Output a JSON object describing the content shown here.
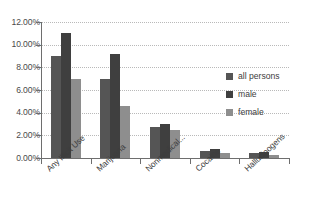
{
  "chart_data": {
    "type": "bar",
    "title": "",
    "xlabel": "",
    "ylabel": "",
    "grid": true,
    "legend_position": "right",
    "ylim": [
      0,
      12
    ],
    "ytick_labels": [
      "12.00%",
      "10.00%",
      "8.00%",
      "6.00%",
      "4.00%",
      "2.00%",
      "0.00%"
    ],
    "ytick_values": [
      12,
      10,
      8,
      6,
      4,
      2,
      0
    ],
    "categories": [
      "Any Illicit Use",
      "Marijuana",
      "Nonmedical...",
      "Cocaine",
      "Hallucinogens"
    ],
    "series": [
      {
        "name": "all persons",
        "color": "#555555",
        "values": [
          9.0,
          7.0,
          2.7,
          0.6,
          0.4
        ]
      },
      {
        "name": "male",
        "color": "#3f3f3f",
        "values": [
          11.0,
          9.2,
          3.0,
          0.8,
          0.55
        ]
      },
      {
        "name": "female",
        "color": "#8e8e8e",
        "values": [
          7.0,
          4.6,
          2.5,
          0.4,
          0.25
        ]
      }
    ]
  },
  "legend": {
    "entries": [
      {
        "label": "all persons"
      },
      {
        "label": "male"
      },
      {
        "label": "female"
      }
    ]
  }
}
